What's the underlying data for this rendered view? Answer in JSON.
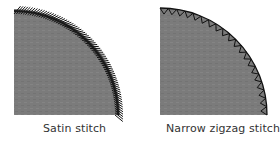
{
  "figure": {
    "panels": [
      {
        "label": "Satin stitch",
        "stitch_type": "satin",
        "fill_color": "#7b7b7b",
        "stitch_color": "#111111"
      },
      {
        "label": "Narrow zigzag stitch",
        "stitch_type": "zigzag",
        "fill_color": "#7b7b7b",
        "stitch_color": "#111111"
      }
    ]
  }
}
